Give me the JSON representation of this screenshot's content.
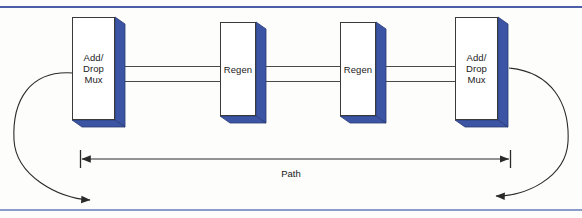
{
  "figure": {
    "background_color": "#fdfdfc",
    "rule_color": "#4a5fa8"
  },
  "colors": {
    "box_face": "#ffffff",
    "box_side_3d": "#3b55a4",
    "box_outline": "#3a3a3a",
    "line": "#4a4a4a",
    "text": "#1a1a1a",
    "rule_top": "#4a5fa8",
    "rule_bottom": "#8a9ccc"
  },
  "nodes": [
    {
      "id": "add-drop-mux-left",
      "label": "Add/\nDrop\nMux",
      "x": 72,
      "y": 17,
      "width": 43,
      "height": 103,
      "depth": 10
    },
    {
      "id": "regen-1",
      "label": "Regen",
      "x": 220,
      "y": 22,
      "width": 36,
      "height": 94,
      "depth": 10
    },
    {
      "id": "regen-2",
      "label": "Regen",
      "x": 340,
      "y": 22,
      "width": 36,
      "height": 94,
      "depth": 10
    },
    {
      "id": "add-drop-mux-right",
      "label": "Add/\nDrop\nMux",
      "x": 455,
      "y": 17,
      "width": 43,
      "height": 103,
      "depth": 10
    }
  ],
  "links": [
    {
      "id": "link-1-upper",
      "x": 125,
      "y": 66,
      "width": 95
    },
    {
      "id": "link-1-lower",
      "x": 125,
      "y": 81,
      "width": 95
    },
    {
      "id": "link-2-upper",
      "x": 266,
      "y": 66,
      "width": 74
    },
    {
      "id": "link-2-lower",
      "x": 266,
      "y": 81,
      "width": 74
    },
    {
      "id": "link-3-upper",
      "x": 386,
      "y": 66,
      "width": 69
    },
    {
      "id": "link-3-lower",
      "x": 386,
      "y": 81,
      "width": 69
    }
  ],
  "path_measure": {
    "label": "Path",
    "left_tick_x": 80,
    "right_tick_x": 510,
    "y": 159,
    "tick_half_height": 9
  },
  "loops": [
    {
      "id": "loop-left",
      "description": "curved loop-back from left mux out to the left and down, arrow pointing right",
      "arrow_direction": "right"
    },
    {
      "id": "loop-right",
      "description": "curved loop-back from right mux out to the right and down, arrow pointing left",
      "arrow_direction": "left"
    }
  ]
}
